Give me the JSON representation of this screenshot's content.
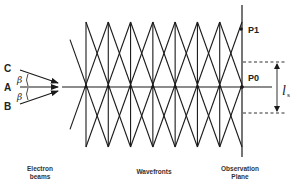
{
  "diagram": {
    "beams": [
      {
        "label": "C",
        "role": "upper-beam"
      },
      {
        "label": "A",
        "role": "central-beam"
      },
      {
        "label": "B",
        "role": "lower-beam"
      }
    ],
    "angle_symbol": "β",
    "points": [
      {
        "label": "P1"
      },
      {
        "label": "P0"
      }
    ],
    "spacing_symbol": "l",
    "spacing_subscript": "s",
    "wavefront_crossings_count": 8,
    "captions": {
      "electron_beams_line1": "Electron",
      "electron_beams_line2": "beams",
      "wavefronts": "Wavefronts",
      "observation_line1": "Observation",
      "observation_line2": "Plane"
    },
    "colors": {
      "line": "#1a1a1a",
      "background": "#ffffff"
    }
  }
}
